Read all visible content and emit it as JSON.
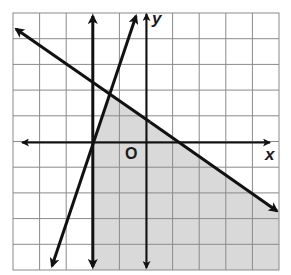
{
  "graph": {
    "type": "coordinate-plane-linear-inequalities",
    "grid": {
      "columns": 10,
      "rows": 10,
      "x_range": [
        -5,
        5
      ],
      "y_range": [
        -5,
        5
      ]
    },
    "axis_labels": {
      "x": "x",
      "y": "y",
      "origin": "O"
    },
    "colors": {
      "grid_line": "#8a8a8a",
      "axis": "#111111",
      "boundary_line": "#111111",
      "shaded_region": "#d9d9d9",
      "background": "#ffffff"
    },
    "boundary_lines": [
      {
        "name": "vertical-line",
        "equation": "x = -2",
        "style": "solid"
      },
      {
        "name": "steep-line",
        "equation": "y = 3x + 6",
        "style": "solid"
      },
      {
        "name": "diagonal-line",
        "equation": "y ≈ -0.7x + 0.9",
        "style": "solid"
      }
    ],
    "shaded_region": "right of x = -2, below the diagonal line, and right of the steep line"
  }
}
